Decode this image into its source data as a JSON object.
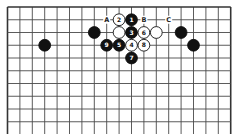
{
  "diagram": {
    "type": "go-board",
    "grid": {
      "columns": 19,
      "x0": 7.5,
      "y0": 7,
      "spacing_x": 12.4,
      "spacing_y": 12.75,
      "visible_rows": 11,
      "line_color": "#4a4a4a",
      "edge_color": "#333333"
    },
    "stones": [
      {
        "color": "black",
        "col": 10,
        "row": 1,
        "label": "1"
      },
      {
        "color": "white",
        "col": 9,
        "row": 1,
        "label": "2"
      },
      {
        "color": "black",
        "col": 10,
        "row": 2,
        "label": "3"
      },
      {
        "color": "white",
        "col": 10,
        "row": 3,
        "label": "4"
      },
      {
        "color": "black",
        "col": 9,
        "row": 3,
        "label": "5"
      },
      {
        "color": "white",
        "col": 11,
        "row": 2,
        "label": "6"
      },
      {
        "color": "black",
        "col": 10,
        "row": 4,
        "label": "7"
      },
      {
        "color": "white",
        "col": 11,
        "row": 3,
        "label": "8"
      },
      {
        "color": "black",
        "col": 8,
        "row": 3,
        "label": "9"
      },
      {
        "color": "black",
        "col": 7,
        "row": 2,
        "label": ""
      },
      {
        "color": "white",
        "col": 9,
        "row": 2,
        "label": ""
      },
      {
        "color": "white",
        "col": 12,
        "row": 2,
        "label": ""
      },
      {
        "color": "black",
        "col": 14,
        "row": 2,
        "label": ""
      },
      {
        "color": "black",
        "col": 3,
        "row": 3,
        "label": ""
      },
      {
        "color": "black",
        "col": 15,
        "row": 3,
        "label": ""
      }
    ],
    "markers": [
      {
        "col": 8,
        "row": 1,
        "label": "A"
      },
      {
        "col": 11,
        "row": 1,
        "label": "B"
      },
      {
        "col": 13,
        "row": 1,
        "label": "C"
      }
    ]
  }
}
